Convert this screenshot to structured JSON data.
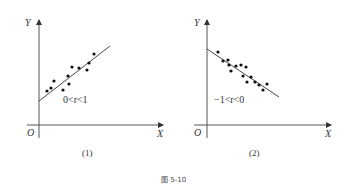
{
  "figure": {
    "caption": "图 5-10"
  },
  "chart_data": [
    {
      "type": "scatter",
      "title": "",
      "subtitle": "(1)",
      "xlabel": "X",
      "ylabel": "Y",
      "origin_label": "O",
      "annotation": "0<r<1",
      "grid": false,
      "trend": "positive",
      "points_px": [
        [
          47,
          91
        ],
        [
          51,
          88
        ],
        [
          54,
          81
        ],
        [
          63,
          90
        ],
        [
          68,
          76
        ],
        [
          69,
          84
        ],
        [
          72,
          67
        ],
        [
          79,
          68
        ],
        [
          87,
          70
        ],
        [
          89,
          63
        ],
        [
          94,
          54
        ]
      ],
      "fit_line_px": [
        [
          39,
          101
        ],
        [
          110,
          46
        ]
      ]
    },
    {
      "type": "scatter",
      "title": "",
      "subtitle": "(2)",
      "xlabel": "X",
      "ylabel": "Y",
      "origin_label": "O",
      "annotation": "−1<r<0",
      "grid": false,
      "trend": "negative",
      "points_px": [
        [
          218,
          52
        ],
        [
          223,
          61
        ],
        [
          228,
          60
        ],
        [
          229,
          65
        ],
        [
          231,
          71
        ],
        [
          236,
          66
        ],
        [
          241,
          65
        ],
        [
          243,
          76
        ],
        [
          246,
          67
        ],
        [
          247,
          82
        ],
        [
          251,
          77
        ],
        [
          255,
          82
        ],
        [
          259,
          85
        ],
        [
          263,
          90
        ],
        [
          267,
          84
        ]
      ],
      "fit_line_px": [
        [
          207,
          49
        ],
        [
          279,
          97
        ]
      ]
    }
  ]
}
